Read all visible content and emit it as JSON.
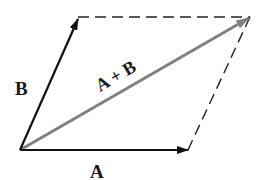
{
  "diagram": {
    "vectors": {
      "A": {
        "label": "A",
        "from": [
          20,
          150
        ],
        "to": [
          188,
          150
        ],
        "color": "#111111"
      },
      "B": {
        "label": "B",
        "from": [
          20,
          150
        ],
        "to": [
          78,
          19
        ],
        "color": "#111111"
      },
      "sum": {
        "label": "A + B",
        "from": [
          20,
          150
        ],
        "to": [
          250,
          17
        ],
        "color": "#808080"
      }
    },
    "dashed_edges": [
      {
        "from": [
          78,
          17
        ],
        "to": [
          250,
          17
        ]
      },
      {
        "from": [
          250,
          17
        ],
        "to": [
          188,
          150
        ]
      }
    ]
  }
}
